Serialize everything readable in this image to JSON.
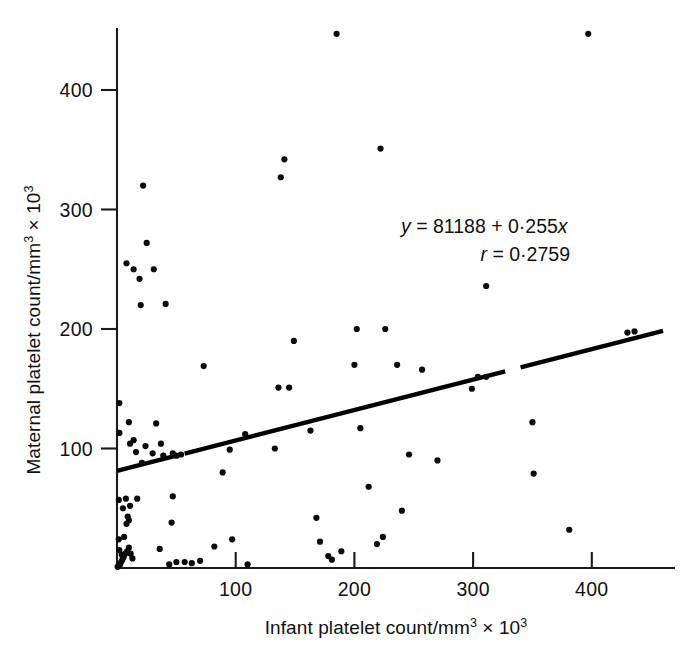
{
  "chart_data": {
    "type": "scatter",
    "title": "",
    "xlabel": "Infant platelet count/mm³ × 10³",
    "ylabel": "Maternal platelet count/mm³ × 10³",
    "xlabel_parts": {
      "base": "Infant platelet count/mm",
      "sup1": "3",
      "times": "× 10",
      "sup2": "3"
    },
    "ylabel_parts": {
      "base": "Maternal platelet count/mm",
      "sup1": "3",
      "times": "× 10",
      "sup2": "3"
    },
    "xlim": [
      0,
      460
    ],
    "ylim": [
      0,
      470
    ],
    "xticks": [
      100,
      200,
      300,
      400
    ],
    "yticks": [
      100,
      200,
      300,
      400
    ],
    "xtick_labels": [
      "100",
      "200",
      "300",
      "400"
    ],
    "ytick_labels": [
      "100",
      "200",
      "300",
      "400"
    ],
    "grid": false,
    "legend": "none",
    "marker_color": "#0b0b0b",
    "line_color": "#000000",
    "annotations": [
      {
        "name": "regression-equation",
        "text": "y = 81188 + 0·255x"
      },
      {
        "name": "correlation-coefficient",
        "text": "r = 0·2759"
      }
    ],
    "equation": {
      "y_symbol": "y",
      "eq1": " = 81188 + 0·255",
      "x_symbol": "x",
      "r_symbol": "r",
      "eq2": " = 0·2759"
    },
    "fit_line": {
      "intercept": 81.188,
      "slope": 0.255,
      "x_start": 0,
      "x_end": 460,
      "gap_x": [
        50,
        57
      ],
      "gap2_x": [
        327,
        340
      ],
      "note": "y = 81188 + 0.255x (counts); plotted in thousands"
    },
    "points": [
      [
        0.5,
        1
      ],
      [
        1.5,
        2
      ],
      [
        2.5,
        3
      ],
      [
        3.5,
        5
      ],
      [
        4.5,
        7
      ],
      [
        5.5,
        9
      ],
      [
        7,
        12
      ],
      [
        8.5,
        14
      ],
      [
        10,
        17
      ],
      [
        11.5,
        12
      ],
      [
        13,
        8
      ],
      [
        4,
        11
      ],
      [
        2,
        15
      ],
      [
        1.5,
        24
      ],
      [
        6,
        26
      ],
      [
        8,
        37
      ],
      [
        10,
        40
      ],
      [
        9,
        43
      ],
      [
        5,
        50
      ],
      [
        11,
        52
      ],
      [
        1.5,
        57
      ],
      [
        7.5,
        58
      ],
      [
        17,
        58
      ],
      [
        2,
        113
      ],
      [
        11,
        104
      ],
      [
        14,
        107
      ],
      [
        16,
        97
      ],
      [
        21,
        88
      ],
      [
        24,
        102
      ],
      [
        30,
        96
      ],
      [
        37,
        104
      ],
      [
        39,
        94
      ],
      [
        47,
        96
      ],
      [
        50,
        94
      ],
      [
        54,
        95
      ],
      [
        2,
        138
      ],
      [
        10,
        122
      ],
      [
        33,
        121
      ],
      [
        22,
        320
      ],
      [
        8,
        255
      ],
      [
        14,
        250
      ],
      [
        19,
        242
      ],
      [
        25,
        272
      ],
      [
        31,
        250
      ],
      [
        20,
        220
      ],
      [
        41,
        221
      ],
      [
        50,
        5
      ],
      [
        57,
        5
      ],
      [
        36,
        16
      ],
      [
        47,
        60
      ],
      [
        46,
        38
      ],
      [
        44,
        3
      ],
      [
        63,
        4
      ],
      [
        70,
        6
      ],
      [
        73,
        169
      ],
      [
        82,
        18
      ],
      [
        95,
        99
      ],
      [
        89,
        80
      ],
      [
        97,
        24
      ],
      [
        110,
        3
      ],
      [
        108,
        112
      ],
      [
        136,
        151
      ],
      [
        145,
        151
      ],
      [
        138,
        327
      ],
      [
        141,
        342
      ],
      [
        133,
        100
      ],
      [
        149,
        190
      ],
      [
        163,
        115
      ],
      [
        168,
        42
      ],
      [
        171,
        22
      ],
      [
        178,
        10
      ],
      [
        181,
        7
      ],
      [
        185,
        447
      ],
      [
        189,
        14
      ],
      [
        202,
        200
      ],
      [
        200,
        170
      ],
      [
        205,
        117
      ],
      [
        212,
        68
      ],
      [
        219,
        20
      ],
      [
        222,
        351
      ],
      [
        224,
        26
      ],
      [
        226,
        200
      ],
      [
        236,
        170
      ],
      [
        240,
        48
      ],
      [
        246,
        95
      ],
      [
        257,
        166
      ],
      [
        270,
        90
      ],
      [
        299,
        150
      ],
      [
        304,
        160
      ],
      [
        311,
        160
      ],
      [
        311,
        236
      ],
      [
        350,
        122
      ],
      [
        351,
        79
      ],
      [
        381,
        32
      ],
      [
        397,
        447
      ],
      [
        430,
        197
      ],
      [
        436,
        198
      ]
    ]
  }
}
